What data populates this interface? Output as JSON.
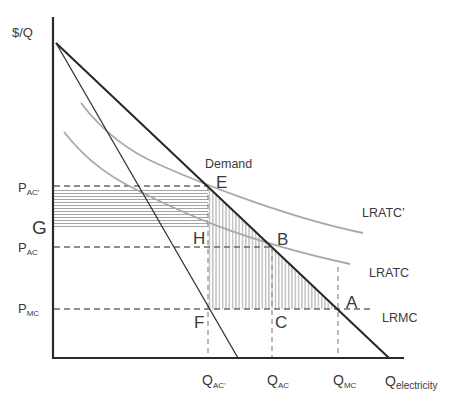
{
  "diagram": {
    "axes": {
      "y_label": "$/Q",
      "x_label": {
        "main": "Q",
        "sub": "electricity"
      }
    },
    "price_labels": {
      "p_ac_prime": {
        "main": "P",
        "sub": "AC’"
      },
      "g": "G",
      "p_ac": {
        "main": "P",
        "sub": "AC"
      },
      "p_mc": {
        "main": "P",
        "sub": "MC"
      }
    },
    "quantity_labels": {
      "q_ac_prime": {
        "main": "Q",
        "sub": "AC’"
      },
      "q_ac": {
        "main": "Q",
        "sub": "AC"
      },
      "q_mc": {
        "main": "Q",
        "sub": "MC"
      }
    },
    "curve_labels": {
      "demand": "Demand",
      "lratc_prime": "LRATC’",
      "lratc": "LRATC",
      "lrmc": "LRMC"
    },
    "points": {
      "e": "E",
      "h": "H",
      "b": "B",
      "f": "F",
      "c": "C",
      "a": "A"
    },
    "colors": {
      "axis": "#2a2a2a",
      "demand": "#262626",
      "cost_curves": "#a8a8a8",
      "dashed_guides": "#6a6a6a",
      "hatching": "#9a9a9a"
    }
  }
}
